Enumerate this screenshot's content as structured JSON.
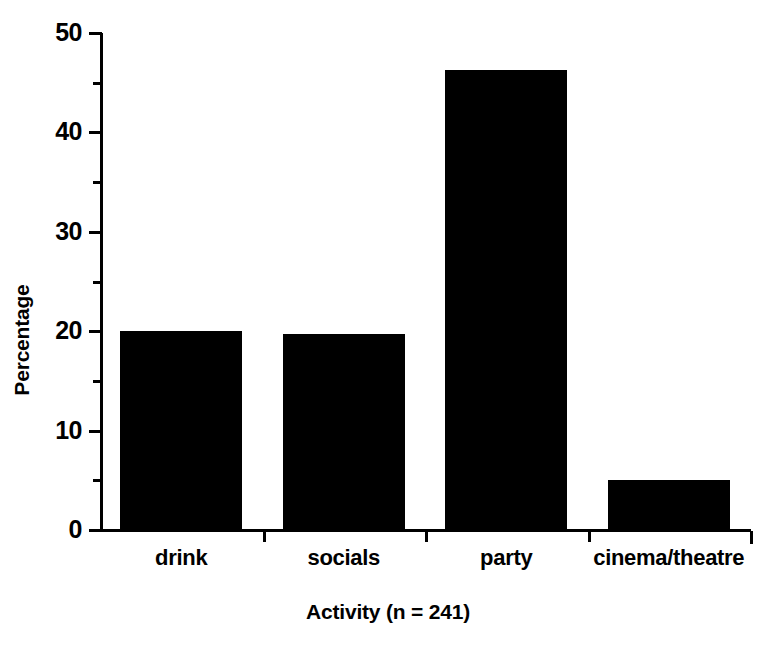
{
  "chart_data": {
    "type": "bar",
    "title": "",
    "subtitle": "",
    "xlabel": "Activity (n = 241)",
    "ylabel": "Percentage",
    "categories": [
      "drink",
      "socials",
      "party",
      "cinema/theatre"
    ],
    "values": [
      20.0,
      19.7,
      46.3,
      5.0
    ],
    "series": [
      {
        "name": "Percentage",
        "values": [
          20.0,
          19.7,
          46.3,
          5.0
        ]
      }
    ],
    "ylim": [
      0,
      50
    ],
    "xlim": [
      0,
      4
    ],
    "y_major_ticks": [
      0,
      10,
      20,
      30,
      40,
      50
    ],
    "y_tick_labels": [
      "0",
      "10",
      "20",
      "30",
      "40",
      "50"
    ],
    "y_minor_ticks": [
      5,
      15,
      25,
      35,
      45
    ],
    "grid": false,
    "legend": false,
    "legend_position": "none",
    "bar_color": "#000000",
    "background_color": "#ffffff",
    "axis_color": "#000000",
    "annotations": []
  },
  "axes": {
    "y_title": "Percentage",
    "x_title": "Activity (n = 241)"
  }
}
